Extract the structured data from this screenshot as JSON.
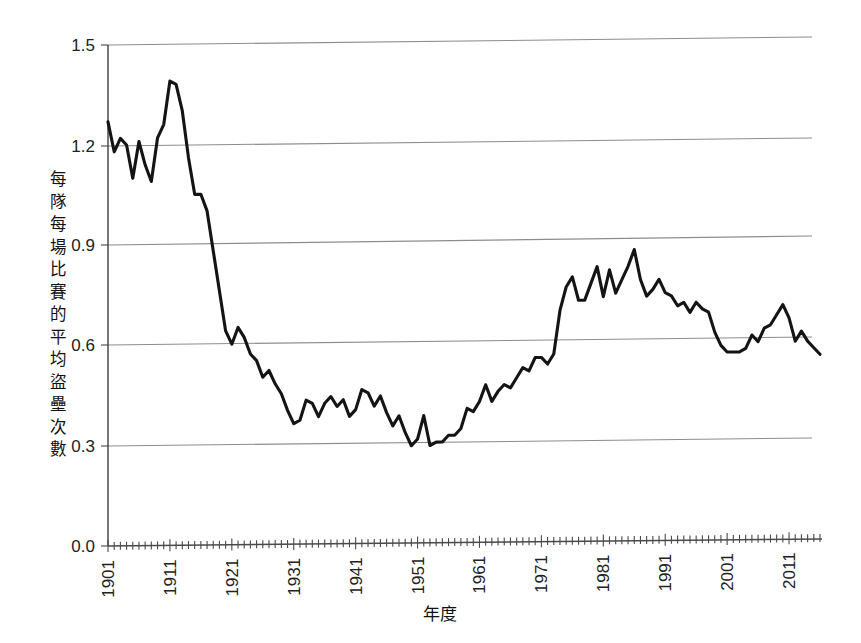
{
  "chart_data": {
    "type": "line",
    "title": "",
    "subtitle": "",
    "xlabel": "年度",
    "ylabel": "每隊每場比賽的平均盜壘次數",
    "xlim": [
      1901,
      2016
    ],
    "ylim": [
      0.0,
      1.5
    ],
    "grid": true,
    "legend": null,
    "y_ticks": [
      "0.0",
      "0.3",
      "0.6",
      "0.9",
      "1.2",
      "1.5"
    ],
    "y_tick_values": [
      0.0,
      0.3,
      0.6,
      0.9,
      1.2,
      1.5
    ],
    "x_ticks": [
      "1901",
      "1911",
      "1921",
      "1931",
      "1941",
      "1951",
      "1961",
      "1971",
      "1981",
      "1991",
      "2001",
      "2011"
    ],
    "x_tick_values": [
      1901,
      1911,
      1921,
      1931,
      1941,
      1951,
      1961,
      1971,
      1981,
      1991,
      2001,
      2011
    ],
    "x_minor_tick_interval": 1,
    "series": [
      {
        "name": "每隊每場比賽的平均盜壘次數",
        "color": "#141414",
        "x": [
          1901,
          1902,
          1903,
          1904,
          1905,
          1906,
          1907,
          1908,
          1909,
          1910,
          1911,
          1912,
          1913,
          1914,
          1915,
          1916,
          1917,
          1918,
          1919,
          1920,
          1921,
          1922,
          1923,
          1924,
          1925,
          1926,
          1927,
          1928,
          1929,
          1930,
          1931,
          1932,
          1933,
          1934,
          1935,
          1936,
          1937,
          1938,
          1939,
          1940,
          1941,
          1942,
          1943,
          1944,
          1945,
          1946,
          1947,
          1948,
          1949,
          1950,
          1951,
          1952,
          1953,
          1954,
          1955,
          1956,
          1957,
          1958,
          1959,
          1960,
          1961,
          1962,
          1963,
          1964,
          1965,
          1966,
          1967,
          1968,
          1969,
          1970,
          1971,
          1972,
          1973,
          1974,
          1975,
          1976,
          1977,
          1978,
          1979,
          1980,
          1981,
          1982,
          1983,
          1984,
          1985,
          1986,
          1987,
          1988,
          1989,
          1990,
          1991,
          1992,
          1993,
          1994,
          1995,
          1996,
          1997,
          1998,
          1999,
          2000,
          2001,
          2002,
          2003,
          2004,
          2005,
          2006,
          2007,
          2008,
          2009,
          2010,
          2011,
          2012,
          2013,
          2014,
          2015,
          2016
        ],
        "values": [
          1.27,
          1.18,
          1.22,
          1.2,
          1.1,
          1.21,
          1.14,
          1.09,
          1.22,
          1.26,
          1.39,
          1.38,
          1.3,
          1.16,
          1.05,
          1.05,
          1.0,
          0.88,
          0.76,
          0.64,
          0.6,
          0.65,
          0.62,
          0.57,
          0.55,
          0.5,
          0.52,
          0.48,
          0.45,
          0.4,
          0.36,
          0.37,
          0.43,
          0.42,
          0.38,
          0.42,
          0.44,
          0.41,
          0.43,
          0.38,
          0.4,
          0.46,
          0.45,
          0.41,
          0.44,
          0.39,
          0.35,
          0.38,
          0.33,
          0.29,
          0.31,
          0.38,
          0.29,
          0.3,
          0.3,
          0.32,
          0.32,
          0.34,
          0.4,
          0.39,
          0.42,
          0.47,
          0.42,
          0.45,
          0.47,
          0.46,
          0.49,
          0.52,
          0.51,
          0.55,
          0.55,
          0.53,
          0.56,
          0.69,
          0.76,
          0.79,
          0.72,
          0.72,
          0.77,
          0.82,
          0.73,
          0.81,
          0.74,
          0.78,
          0.82,
          0.87,
          0.78,
          0.73,
          0.75,
          0.78,
          0.74,
          0.73,
          0.7,
          0.71,
          0.68,
          0.71,
          0.69,
          0.68,
          0.62,
          0.58,
          0.56,
          0.56,
          0.56,
          0.57,
          0.61,
          0.59,
          0.63,
          0.64,
          0.67,
          0.7,
          0.66,
          0.59,
          0.62,
          0.59,
          0.57,
          0.55
        ]
      }
    ]
  },
  "axes": {
    "y_label_chars": [
      "每",
      "隊",
      "每",
      "場",
      "比",
      "賽",
      "的",
      "平",
      "均",
      "盜",
      "壘",
      "次",
      "數"
    ],
    "x_title": "年度"
  }
}
